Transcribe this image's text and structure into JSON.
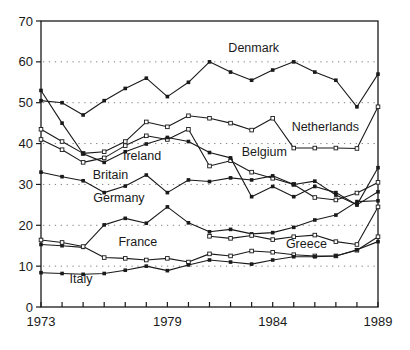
{
  "chart_data": {
    "type": "line",
    "title": "",
    "xlabel": "",
    "ylabel": "",
    "x": [
      1973,
      1974,
      1975,
      1976,
      1977,
      1978,
      1979,
      1980,
      1981,
      1982,
      1983,
      1984,
      1985,
      1986,
      1987,
      1988,
      1989
    ],
    "xlim": [
      1973,
      1989
    ],
    "ylim": [
      0,
      70
    ],
    "yticks": [
      0,
      10,
      20,
      30,
      40,
      50,
      60,
      70
    ],
    "xtick_labels": [
      "1973",
      "1979",
      "1984",
      "1989"
    ],
    "xtick_label_years": [
      1973,
      1979,
      1984,
      1989
    ],
    "grid": {
      "horizontal_at": [
        10,
        20,
        30,
        40,
        50,
        60
      ],
      "style": "dotted"
    },
    "legend_position": "inline-labels",
    "colors": {
      "line": "#1a1a1a",
      "frame": "#1a1a1a",
      "grid": "#808080",
      "background": "#ffffff"
    },
    "series": [
      {
        "name": "Denmark",
        "marker": "filled",
        "values": [
          50.5,
          50,
          47,
          50.5,
          53.5,
          56,
          51.5,
          55,
          60,
          57.5,
          55.5,
          58,
          60,
          57.5,
          55.5,
          49,
          57
        ],
        "label": {
          "x": 1983.1,
          "y": 62.4
        }
      },
      {
        "name": "Netherlands",
        "marker": "open",
        "values": [
          43.5,
          40.5,
          37.6,
          38,
          40.5,
          45.3,
          44.1,
          46.8,
          46.2,
          45,
          43.3,
          46.2,
          38.9,
          38.9,
          38.9,
          38.8,
          49
        ],
        "label": {
          "x": 1986.5,
          "y": 43.0
        }
      },
      {
        "name": "Belgium",
        "marker": "open",
        "values": [
          41,
          38.5,
          35.4,
          36.5,
          39.5,
          41.9,
          41,
          43.5,
          34.5,
          35.8,
          33,
          31.5,
          30,
          26.8,
          26.2,
          27.9,
          30.5
        ],
        "label": {
          "x": 1983.6,
          "y": 37.0
        }
      },
      {
        "name": "Ireland",
        "marker": "filled",
        "values": [
          53,
          45,
          37.5,
          35.4,
          38,
          39.9,
          41.5,
          40.5,
          37.8,
          36.5,
          27,
          29.5,
          27,
          29.5,
          28,
          25,
          34.1
        ],
        "label": {
          "x": 1977.8,
          "y": 36.0
        }
      },
      {
        "name": "Britain",
        "marker": "filled",
        "values": [
          33,
          31.9,
          30.9,
          28,
          29.6,
          32.3,
          28,
          31.1,
          30.7,
          31.6,
          31.1,
          32.1,
          30,
          30.8,
          27.4,
          25,
          28.2
        ],
        "label": {
          "x": 1976.3,
          "y": 31.4
        }
      },
      {
        "name": "Germany",
        "marker": "filled",
        "values": [
          15.3,
          15,
          14.6,
          20.1,
          21.7,
          20.5,
          24.5,
          20.6,
          18.4,
          19,
          17.9,
          18.2,
          19.5,
          21.3,
          22.5,
          25.8,
          26
        ],
        "label": {
          "x": 1976.7,
          "y": 25.6
        }
      },
      {
        "name": "France",
        "marker": "open",
        "values": [
          16.4,
          15.8,
          14.8,
          12.1,
          11.9,
          11.5,
          11.9,
          11,
          13,
          12.5,
          13.7,
          13.4,
          12.8,
          12.5,
          12.5,
          13.9,
          17.2
        ],
        "label": {
          "x": 1977.6,
          "y": 15.0
        }
      },
      {
        "name": "Greece",
        "marker": "open",
        "values": [
          null,
          null,
          null,
          null,
          null,
          null,
          null,
          null,
          17.3,
          16.8,
          17.5,
          16.5,
          17.2,
          17.6,
          16,
          15.3,
          24.5
        ],
        "label": {
          "x": 1985.6,
          "y": 14.4
        }
      },
      {
        "name": "Italy",
        "marker": "filled",
        "values": [
          8.4,
          8.2,
          8,
          8.2,
          9,
          10,
          8.9,
          10.3,
          11.5,
          11,
          10.5,
          11.5,
          12.3,
          12.3,
          12.5,
          14,
          16
        ],
        "label": {
          "x": 1974.9,
          "y": 5.8
        }
      }
    ]
  }
}
